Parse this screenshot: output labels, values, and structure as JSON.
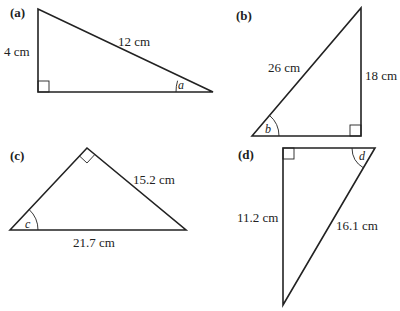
{
  "figures": [
    {
      "id": "a",
      "part_label": "(a)",
      "side_labels": {
        "vertical_leg": "4 cm",
        "hypotenuse": "12 cm"
      },
      "angle_label": "a",
      "right_angle": "bottom-left"
    },
    {
      "id": "b",
      "part_label": "(b)",
      "side_labels": {
        "hypotenuse": "26 cm",
        "vertical_leg": "18 cm"
      },
      "angle_label": "b",
      "right_angle": "bottom-right"
    },
    {
      "id": "c",
      "part_label": "(c)",
      "side_labels": {
        "right_leg": "15.2 cm",
        "hypotenuse": "21.7 cm"
      },
      "angle_label": "c",
      "right_angle": "top"
    },
    {
      "id": "d",
      "part_label": "(d)",
      "side_labels": {
        "vertical_leg": "11.2 cm",
        "hypotenuse": "16.1 cm"
      },
      "angle_label": "d",
      "right_angle": "top-left"
    }
  ]
}
